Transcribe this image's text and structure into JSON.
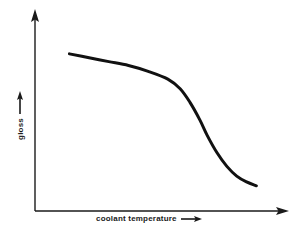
{
  "figure": {
    "background_color": "#ffffff",
    "ink_color": "#1a1a1a",
    "curve_color": "#111111"
  },
  "axes": {
    "x": {
      "label": "coolant temperature",
      "arrow_icon": "arrow-right-icon",
      "has_ticks": false,
      "has_tick_labels": false
    },
    "y": {
      "label": "gloss",
      "arrow_icon": "arrow-up-icon",
      "has_ticks": false,
      "has_tick_labels": false
    }
  },
  "chart_data": {
    "type": "line",
    "title": "",
    "subtitle": "",
    "xlabel": "coolant temperature",
    "ylabel": "gloss",
    "xlim": [
      0,
      100
    ],
    "ylim": [
      0,
      100
    ],
    "grid": false,
    "legend": false,
    "legend_position": "none",
    "axis_tick_labels": {
      "x": [],
      "y": []
    },
    "annotations": [],
    "series": [
      {
        "name": "gloss vs coolant temperature",
        "color": "#111111",
        "line_width": 3,
        "x": [
          14,
          22,
          30,
          38,
          46,
          54,
          59,
          63,
          67,
          70,
          74,
          78,
          82,
          86,
          90
        ],
        "y": [
          81,
          79,
          77,
          75,
          72,
          68,
          63,
          56,
          47,
          39,
          30,
          23,
          18,
          15,
          13
        ]
      }
    ]
  }
}
